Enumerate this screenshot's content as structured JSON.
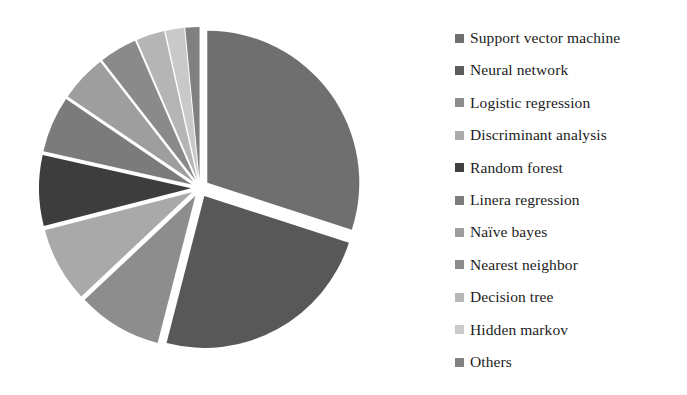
{
  "chart_data": {
    "type": "pie",
    "title": "",
    "subtitle": "",
    "xlabel": "",
    "ylabel": "",
    "grid": false,
    "legend_position": "right",
    "exploded": true,
    "units": "percent",
    "categories": [
      "Support vector machine",
      "Neural network",
      "Logistic regression",
      "Discriminant analysis",
      "Random forest",
      "Linera regression",
      "Naïve bayes",
      "Nearest neighbor",
      "Decision tree",
      "Hidden markov",
      "Others"
    ],
    "values": [
      30.0,
      24.0,
      9.0,
      8.0,
      7.5,
      6.0,
      5.0,
      4.0,
      3.0,
      2.0,
      1.5
    ],
    "colors": [
      "#6f6f6f",
      "#585858",
      "#8d8d8d",
      "#a9a9a9",
      "#3d3d3d",
      "#7b7b7b",
      "#9e9e9e",
      "#8a8a8a",
      "#b5b5b5",
      "#c9c9c9",
      "#808080"
    ],
    "slices": [
      {
        "label": "Support vector machine",
        "value": 30.0,
        "color": "#6f6f6f",
        "swatch": "#6f6f6f"
      },
      {
        "label": "Neural network",
        "value": 24.0,
        "color": "#585858",
        "swatch": "#5c5c5c"
      },
      {
        "label": "Logistic regression",
        "value": 9.0,
        "color": "#8d8d8d",
        "swatch": "#8d8d8d"
      },
      {
        "label": "Discriminant analysis",
        "value": 8.0,
        "color": "#a9a9a9",
        "swatch": "#ababab"
      },
      {
        "label": "Random forest",
        "value": 7.5,
        "color": "#3d3d3d",
        "swatch": "#3f3f3f"
      },
      {
        "label": "Linera regression",
        "value": 6.0,
        "color": "#7b7b7b",
        "swatch": "#7d7d7d"
      },
      {
        "label": "Naïve bayes",
        "value": 5.0,
        "color": "#9e9e9e",
        "swatch": "#9e9e9e"
      },
      {
        "label": "Nearest neighbor",
        "value": 4.0,
        "color": "#8a8a8a",
        "swatch": "#8c8c8c"
      },
      {
        "label": "Decision tree",
        "value": 3.0,
        "color": "#b5b5b5",
        "swatch": "#b7b7b7"
      },
      {
        "label": "Hidden markov",
        "value": 2.0,
        "color": "#c9c9c9",
        "swatch": "#cacaca"
      },
      {
        "label": "Others",
        "value": 1.5,
        "color": "#808080",
        "swatch": "#828282"
      }
    ]
  },
  "pie": {
    "center_x": 200,
    "center_y": 188,
    "radius": 152,
    "explode_offset": 9,
    "start_angle_deg": 0
  },
  "legend": {
    "items": [
      {
        "label": "Support vector machine"
      },
      {
        "label": "Neural network"
      },
      {
        "label": "Logistic regression"
      },
      {
        "label": "Discriminant analysis"
      },
      {
        "label": "Random forest"
      },
      {
        "label": "Linera regression"
      },
      {
        "label": "Naïve bayes"
      },
      {
        "label": "Nearest neighbor"
      },
      {
        "label": "Decision tree"
      },
      {
        "label": "Hidden markov"
      },
      {
        "label": "Others"
      }
    ]
  },
  "canvas": {
    "background": "#ffffff",
    "width": 687,
    "height": 395
  }
}
